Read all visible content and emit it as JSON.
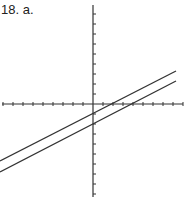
{
  "label": "18. a.",
  "chart_data": {
    "type": "line",
    "title": "18. a.",
    "axes": {
      "x_axis_y_px": 104,
      "y_axis_x_px": 93,
      "tick_spacing_px": 10
    },
    "series": [
      {
        "name": "upper line",
        "points_px": [
          [
            0,
            161
          ],
          [
            176,
            71
          ]
        ]
      },
      {
        "name": "lower line",
        "points_px": [
          [
            0,
            172
          ],
          [
            176,
            81
          ]
        ]
      }
    ],
    "grid": false
  }
}
